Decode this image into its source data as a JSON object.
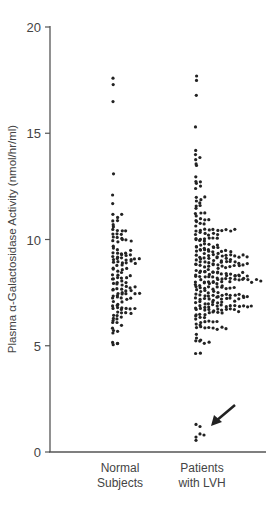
{
  "chart_data": {
    "type": "scatter",
    "subtype": "dot-strip-plot",
    "title": "",
    "xlabel": "",
    "ylabel": "Plasma α-Galactosidase Activity (nmol/hr/ml)",
    "ylim": [
      0,
      20
    ],
    "yticks": [
      0,
      5,
      10,
      15,
      20
    ],
    "grid": false,
    "legend": null,
    "categories": [
      "Normal Subjects",
      "Patients with LVH"
    ],
    "category_lines": [
      [
        "Normal",
        "Subjects"
      ],
      [
        "Patients",
        "with LVH"
      ]
    ],
    "series": [
      {
        "name": "Normal Subjects",
        "approx_count": 100,
        "range": [
          4.8,
          17.6
        ],
        "bulk_range": [
          5.0,
          11.2
        ],
        "outliers_high": [
          17.6,
          17.3,
          16.5,
          13.1,
          12.1,
          11.7
        ],
        "median_approx": 8.0
      },
      {
        "name": "Patients with LVH",
        "approx_count": 330,
        "range": [
          0.6,
          17.7
        ],
        "bulk_range": [
          4.6,
          12.0
        ],
        "outliers_high": [
          17.7,
          17.5,
          16.8,
          15.3,
          14.2,
          14.0
        ],
        "low_cluster": [
          1.3,
          1.2,
          0.9,
          0.8,
          0.7,
          0.6
        ],
        "median_approx": 7.8
      }
    ],
    "annotations": [
      {
        "type": "arrow",
        "target": "low_cluster",
        "series": "Patients with LVH",
        "description": "arrow pointing to patients with very low activity (~1 nmol/hr/ml)"
      }
    ]
  },
  "axis": {
    "ticks": [
      "0",
      "5",
      "10",
      "15",
      "20"
    ]
  },
  "style": {
    "dot_color": "#222222",
    "axis_color": "#555555"
  }
}
